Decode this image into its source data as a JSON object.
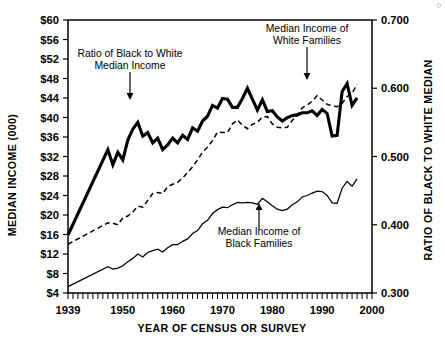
{
  "page": {
    "corner_mark": "0"
  },
  "chart_data": {
    "type": "line",
    "title": "",
    "xlabel": "YEAR OF CENSUS OR SURVEY",
    "ylabel": "MEDIAN INCOME (000)",
    "y2label": "RATIO OF BLACK TO WHITE MEDIAN",
    "xlim": [
      1939,
      2000
    ],
    "ylim": [
      4,
      60
    ],
    "y2lim": [
      0.3,
      0.7
    ],
    "grid": false,
    "legend_position": "inline-annotations",
    "xticks": [
      1939,
      1950,
      1960,
      1970,
      1980,
      1990,
      2000
    ],
    "xtick_labels": [
      "1939",
      "1950",
      "1960",
      "1970",
      "1980",
      "1990",
      "2000"
    ],
    "x_minor_tick_step": 1,
    "yticks": [
      4,
      8,
      12,
      16,
      20,
      24,
      28,
      32,
      36,
      40,
      44,
      48,
      52,
      56,
      60
    ],
    "ytick_labels": [
      "$4",
      "$8",
      "$12",
      "$16",
      "$20",
      "$24",
      "$28",
      "$32",
      "$36",
      "$40",
      "$44",
      "$48",
      "$52",
      "$56",
      "$60"
    ],
    "y2ticks": [
      0.3,
      0.4,
      0.5,
      0.6,
      0.7
    ],
    "y2tick_labels": [
      "0.300",
      "0.400",
      "0.500",
      "0.600",
      "0.700"
    ],
    "series": [
      {
        "name": "Ratio of Black to White Median Income",
        "axis": "right",
        "style": "solid-thick",
        "x": [
          1939,
          1947,
          1948,
          1949,
          1950,
          1951,
          1952,
          1953,
          1954,
          1955,
          1956,
          1957,
          1958,
          1959,
          1960,
          1961,
          1962,
          1963,
          1964,
          1965,
          1966,
          1967,
          1968,
          1969,
          1970,
          1971,
          1972,
          1973,
          1974,
          1975,
          1976,
          1977,
          1978,
          1979,
          1980,
          1981,
          1982,
          1983,
          1984,
          1985,
          1986,
          1987,
          1988,
          1989,
          1990,
          1991,
          1992,
          1993,
          1994,
          1995,
          1996,
          1997
        ],
        "values": [
          0.385,
          0.51,
          0.488,
          0.506,
          0.495,
          0.524,
          0.54,
          0.55,
          0.53,
          0.535,
          0.52,
          0.527,
          0.51,
          0.517,
          0.527,
          0.52,
          0.531,
          0.525,
          0.542,
          0.537,
          0.552,
          0.559,
          0.575,
          0.571,
          0.585,
          0.584,
          0.572,
          0.572,
          0.585,
          0.6,
          0.584,
          0.568,
          0.583,
          0.566,
          0.567,
          0.558,
          0.552,
          0.557,
          0.56,
          0.561,
          0.564,
          0.564,
          0.567,
          0.56,
          0.569,
          0.563,
          0.53,
          0.531,
          0.595,
          0.607,
          0.575,
          0.586
        ]
      },
      {
        "name": "Median Income of White Families",
        "axis": "left",
        "style": "dashed",
        "x": [
          1939,
          1947,
          1948,
          1949,
          1950,
          1951,
          1952,
          1953,
          1954,
          1955,
          1956,
          1957,
          1958,
          1959,
          1960,
          1961,
          1962,
          1963,
          1964,
          1965,
          1966,
          1967,
          1968,
          1969,
          1970,
          1971,
          1972,
          1973,
          1974,
          1975,
          1976,
          1977,
          1978,
          1979,
          1980,
          1981,
          1982,
          1983,
          1984,
          1985,
          1986,
          1987,
          1988,
          1989,
          1990,
          1991,
          1992,
          1993,
          1994,
          1995,
          1996,
          1997
        ],
        "values": [
          14.0,
          18.4,
          18.3,
          18.0,
          19.4,
          19.8,
          20.6,
          21.8,
          21.6,
          23.0,
          24.4,
          24.6,
          24.4,
          25.8,
          26.3,
          26.7,
          27.6,
          28.7,
          29.9,
          31.3,
          32.9,
          33.9,
          35.3,
          37.0,
          36.9,
          36.9,
          38.7,
          39.5,
          38.4,
          37.7,
          38.6,
          39.0,
          40.1,
          40.2,
          38.7,
          38.0,
          37.9,
          38.0,
          39.4,
          40.4,
          42.0,
          42.6,
          43.3,
          44.5,
          43.6,
          42.7,
          42.4,
          42.2,
          42.9,
          44.3,
          45.0,
          46.8
        ]
      },
      {
        "name": "Median Income of Black Families",
        "axis": "left",
        "style": "solid-thin",
        "x": [
          1939,
          1947,
          1948,
          1949,
          1950,
          1951,
          1952,
          1953,
          1954,
          1955,
          1956,
          1957,
          1958,
          1959,
          1960,
          1961,
          1962,
          1963,
          1964,
          1965,
          1966,
          1967,
          1968,
          1969,
          1970,
          1971,
          1972,
          1973,
          1974,
          1975,
          1976,
          1977,
          1978,
          1979,
          1980,
          1981,
          1982,
          1983,
          1984,
          1985,
          1986,
          1987,
          1988,
          1989,
          1990,
          1991,
          1992,
          1993,
          1994,
          1995,
          1996,
          1997
        ],
        "values": [
          5.3,
          9.4,
          8.9,
          9.1,
          9.6,
          10.4,
          11.1,
          12.0,
          11.4,
          12.3,
          12.7,
          13.0,
          12.4,
          13.3,
          13.9,
          13.9,
          14.6,
          15.1,
          16.2,
          16.8,
          18.2,
          18.9,
          20.3,
          21.1,
          21.6,
          21.5,
          22.1,
          22.6,
          22.5,
          22.6,
          22.5,
          22.2,
          23.4,
          22.7,
          21.9,
          21.2,
          20.9,
          21.2,
          22.1,
          22.7,
          23.7,
          24.0,
          24.5,
          24.9,
          24.8,
          24.0,
          22.5,
          22.4,
          25.5,
          26.9,
          25.9,
          27.4
        ]
      }
    ],
    "annotations": [
      {
        "id": "ratio-annotation",
        "lines": [
          "Ratio of Black to White",
          "Median Income"
        ],
        "arrow": "down",
        "points_to_series": "Ratio of Black to White Median Income"
      },
      {
        "id": "white-annotation",
        "lines": [
          "Median Income of",
          "White Families"
        ],
        "arrow": "down",
        "points_to_series": "Median Income of White Families"
      },
      {
        "id": "black-annotation",
        "lines": [
          "Median Income of",
          "Black Families"
        ],
        "arrow": "up",
        "points_to_series": "Median Income of Black Families"
      }
    ]
  }
}
